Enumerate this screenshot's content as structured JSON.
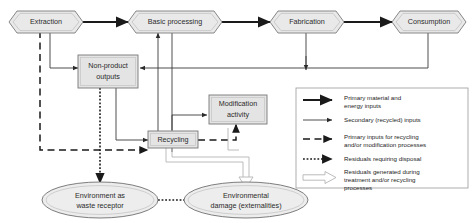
{
  "diagram": {
    "nodes": [
      {
        "id": "extraction",
        "shape": "hexagon",
        "label": "Extraction"
      },
      {
        "id": "basic",
        "shape": "hexagon",
        "label": "Basic processing"
      },
      {
        "id": "fabrication",
        "shape": "hexagon",
        "label": "Fabrication"
      },
      {
        "id": "consumption",
        "shape": "hexagon",
        "label": "Consumption"
      },
      {
        "id": "nonproduct",
        "shape": "rect",
        "label_line1": "Non-product",
        "label_line2": "outputs"
      },
      {
        "id": "modification",
        "shape": "rect",
        "label_line1": "Modification",
        "label_line2": "activity"
      },
      {
        "id": "recycling",
        "shape": "rect",
        "label": "Recycling"
      },
      {
        "id": "waste",
        "shape": "ellipse",
        "label_line1": "Environment as",
        "label_line2": "waste receptor"
      },
      {
        "id": "damage",
        "shape": "ellipse",
        "label_line1": "Environmental",
        "label_line2": "damage (externalities)"
      }
    ]
  },
  "legend": {
    "entries": [
      {
        "style": "primary",
        "line1": "Primary material and",
        "line2": "energy inputs",
        "line3": ""
      },
      {
        "style": "secondary",
        "line1": "Secondary (recycled) inputs",
        "line2": "",
        "line3": ""
      },
      {
        "style": "dashed",
        "line1": "Primary inputs for recycling",
        "line2": "and/or modification processes",
        "line3": ""
      },
      {
        "style": "dotted",
        "line1": "Residuals requiring disposal",
        "line2": "",
        "line3": ""
      },
      {
        "style": "hollow",
        "line1": "Residuals generated during",
        "line2": "treatment and/or recycling",
        "line3": "processes"
      }
    ]
  },
  "colors": {
    "line": "#1a1a1a",
    "node_fill": "#e9e9e9",
    "node_stroke": "#7a7a7a",
    "hollow": "#b4b4b4",
    "background": "#ffffff"
  }
}
